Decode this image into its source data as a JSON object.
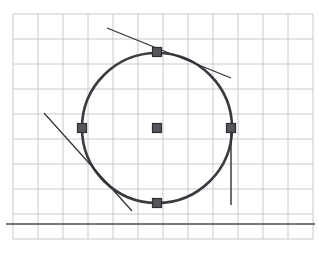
{
  "figure": {
    "canvas": {
      "width": 319,
      "height": 254,
      "background": "#ffffff"
    },
    "grid": {
      "label": "graph-paper-grid",
      "color": "#b9bcc4",
      "line_width": 0.8,
      "spacing": 25,
      "x_start": 13,
      "x_end": 313,
      "y_start": 14,
      "y_end": 239,
      "vertical_lines_x": [
        13,
        38,
        63,
        88,
        113,
        138,
        163,
        188,
        213,
        238,
        263,
        288,
        313
      ],
      "horizontal_lines_y": [
        14,
        39,
        64,
        89,
        114,
        139,
        164,
        189,
        214,
        239
      ]
    },
    "axis": {
      "label": "horizontal-axis",
      "color": "#4a4a52",
      "line_width": 1.6,
      "y": 224,
      "x_start": 6,
      "x_end": 315
    },
    "circle": {
      "label": "main-circle",
      "center_x": 157,
      "center_y": 128,
      "radius": 75,
      "stroke": "#3a3a3f",
      "stroke_width": 2.6,
      "fill": "none"
    },
    "markers": [
      {
        "name": "center-point",
        "x": 157,
        "y": 128,
        "size": 9,
        "color": "#55555c",
        "border": "#2f2f34"
      },
      {
        "name": "top-point",
        "x": 157,
        "y": 52,
        "size": 9,
        "color": "#55555c",
        "border": "#2f2f34"
      },
      {
        "name": "left-point",
        "x": 82,
        "y": 128,
        "size": 9,
        "color": "#55555c",
        "border": "#2f2f34"
      },
      {
        "name": "right-point",
        "x": 231,
        "y": 128,
        "size": 9,
        "color": "#55555c",
        "border": "#2f2f34"
      },
      {
        "name": "bottom-point",
        "x": 157,
        "y": 203,
        "size": 9,
        "color": "#55555c",
        "border": "#2f2f34"
      }
    ],
    "tangent_lines": [
      {
        "name": "top-tangent-line",
        "x1": 107,
        "y1": 28,
        "x2": 231,
        "y2": 78,
        "stroke": "#2f2f34",
        "stroke_width": 1.2
      },
      {
        "name": "lower-left-secant-line",
        "x1": 44,
        "y1": 113,
        "x2": 132,
        "y2": 211,
        "stroke": "#2f2f34",
        "stroke_width": 1.2
      },
      {
        "name": "right-vertical-tangent-line",
        "x1": 231,
        "y1": 128,
        "x2": 231,
        "y2": 205,
        "stroke": "#2f2f34",
        "stroke_width": 1.4
      }
    ]
  }
}
